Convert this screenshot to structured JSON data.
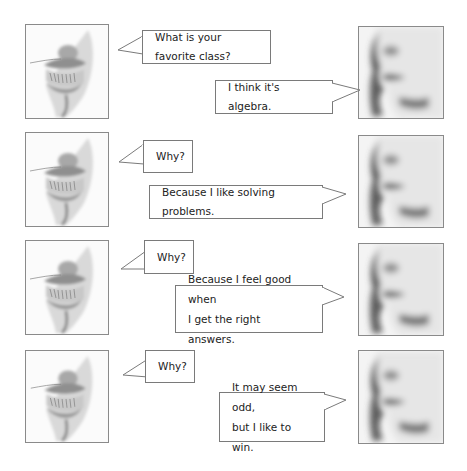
{
  "dialogue": [
    {
      "speaker": "left",
      "text": "What is your favorite class?"
    },
    {
      "speaker": "right",
      "text": "I think it's algebra."
    },
    {
      "speaker": "left",
      "text": "Why?"
    },
    {
      "speaker": "right",
      "text": "Because I like solving problems."
    },
    {
      "speaker": "left",
      "text": "Why?"
    },
    {
      "speaker": "right",
      "lines": [
        "Because I feel good when",
        "I get the right answers."
      ]
    },
    {
      "speaker": "left",
      "text": "Why?"
    },
    {
      "speaker": "right",
      "lines": [
        "It may seem odd,",
        "but I like to win."
      ]
    }
  ],
  "icons": {
    "left_face": "grinning-mouth-sketch",
    "right_face": "profile-face-sketch"
  },
  "colors": {
    "border": "#7a7a7a",
    "background": "#ffffff",
    "text": "#222222"
  }
}
